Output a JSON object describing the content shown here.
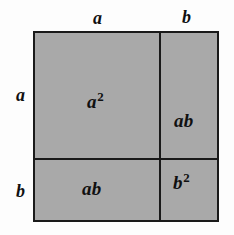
{
  "figure": {
    "identity": "(a + b)^2 = a^2 + 2ab + b^2",
    "background_color": "#fdfdfd",
    "fill_color": "#a9a9a9",
    "line_color": "#1a1a1a"
  },
  "dimension_labels": {
    "top_left": "a",
    "top_right": "b",
    "left_upper": "a",
    "left_lower": "b"
  },
  "cells": {
    "top_left": {
      "base": "a",
      "exponent": "2"
    },
    "top_right": {
      "base": "ab",
      "exponent": ""
    },
    "bottom_left": {
      "base": "ab",
      "exponent": ""
    },
    "bottom_right": {
      "base": "b",
      "exponent": "2"
    }
  },
  "chart_data": {
    "type": "area",
    "categories": [
      "a²",
      "ab",
      "ab",
      "b²"
    ],
    "values": [
      1,
      1,
      1,
      1
    ],
    "xlabel": "",
    "ylabel": "",
    "grid": false,
    "legend": "none"
  }
}
